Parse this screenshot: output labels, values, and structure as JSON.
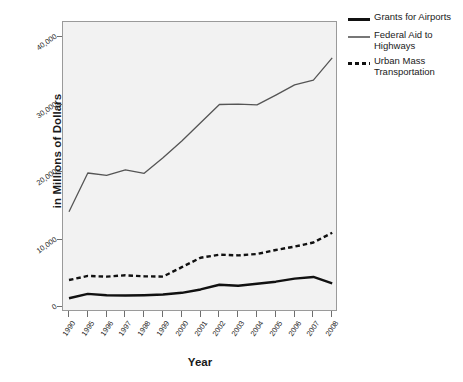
{
  "chart_data": {
    "type": "line",
    "title": "",
    "xlabel": "Year",
    "ylabel": "in Millions of Dollars",
    "categories": [
      "1990",
      "1995",
      "1996",
      "1997",
      "1998",
      "1999",
      "2000",
      "2001",
      "2002",
      "2003",
      "2004",
      "2005",
      "2006",
      "2007",
      "2008"
    ],
    "ylim": [
      0,
      43000
    ],
    "yticks": [
      0,
      10000,
      20000,
      30000,
      40000
    ],
    "ytick_labels": [
      "0",
      "10,000",
      "20,000",
      "30,000",
      "40,000"
    ],
    "grid": false,
    "legend_position": "right",
    "series": [
      {
        "name": "Grants for Airports",
        "style": "solid-thick",
        "color": "#111111",
        "values": [
          1300,
          1950,
          1750,
          1700,
          1750,
          1850,
          2100,
          2600,
          3300,
          3150,
          3450,
          3750,
          4200,
          4450,
          3500
        ]
      },
      {
        "name": "Federal Aid to Highways",
        "style": "solid-thin",
        "color": "#555555",
        "values": [
          14100,
          19850,
          19500,
          20300,
          19800,
          22100,
          24600,
          27300,
          30000,
          30050,
          29950,
          31400,
          32900,
          33600,
          36900
        ]
      },
      {
        "name": "Urban Mass Transportation",
        "style": "dashed",
        "color": "#111111",
        "values": [
          4000,
          4600,
          4500,
          4700,
          4550,
          4500,
          5900,
          7300,
          7750,
          7650,
          7850,
          8450,
          8950,
          9550,
          11000
        ]
      }
    ]
  },
  "legend": {
    "items": [
      {
        "label": "Grants for Airports",
        "style": "solid-thick"
      },
      {
        "label": "Federal Aid to Highways",
        "style": "solid-thin"
      },
      {
        "label": "Urban Mass Transportation",
        "style": "dashed"
      }
    ]
  },
  "axes": {
    "x_title": "Year",
    "y_title": "in Millions of Dollars"
  },
  "colors": {
    "plot_background": "#f2f2f2",
    "frame": "#9a9a9a",
    "series_dark": "#111111",
    "series_gray": "#555555",
    "text": "#1a1a1a"
  }
}
